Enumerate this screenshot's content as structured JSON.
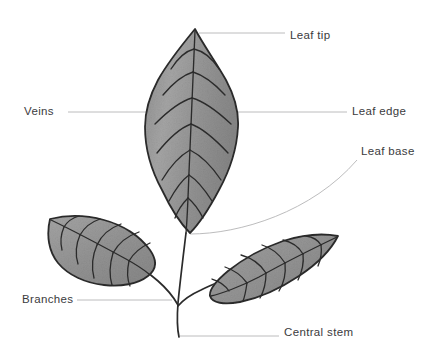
{
  "diagram": {
    "subject": "leaf",
    "background_color": "#ffffff",
    "ink_color": "#2b2b2b",
    "label_color": "#3b3b3d",
    "leader_line_color": "#b4b4b6",
    "leaf_fill_color": "#9a9a9a",
    "leaf_fill_shadow": "#7e7e7e",
    "leaf_fill_highlight": "#b2b2b2"
  },
  "labels": [
    {
      "id": "leaf-tip",
      "text": "Leaf tip",
      "side": "right"
    },
    {
      "id": "leaf-edge",
      "text": "Leaf edge",
      "side": "right"
    },
    {
      "id": "leaf-base",
      "text": "Leaf base",
      "side": "right"
    },
    {
      "id": "veins",
      "text": "Veins",
      "side": "left"
    },
    {
      "id": "branches",
      "text": "Branches",
      "side": "left"
    },
    {
      "id": "central-stem",
      "text": "Central stem",
      "side": "right"
    }
  ],
  "parts": {
    "center_leaf": "center-leaf",
    "left_leaf": "left-leaf",
    "right_leaf": "right-leaf",
    "central_stem": "central-stem",
    "left_branch": "left-branch",
    "right_branch": "right-branch"
  }
}
